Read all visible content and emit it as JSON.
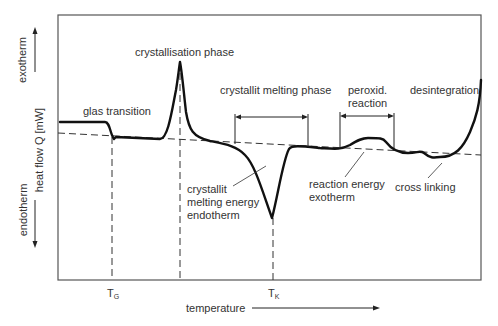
{
  "diagram": {
    "y_axis": {
      "label": "heat flow Q [mW]",
      "up_label": "exotherm",
      "down_label": "endotherm"
    },
    "x_axis": {
      "label": "temperature",
      "markers": [
        {
          "name": "T",
          "sub": "G"
        },
        {
          "name": "T",
          "sub": "K"
        }
      ]
    },
    "annotations": {
      "glass_transition": "glas transition",
      "crystallisation": "crystallisation phase",
      "crystallit_melting_phase": "crystallit melting phase",
      "peroxid_line1": "peroxid.",
      "peroxid_line2": "reaction",
      "desintegration": "desintegration",
      "melting_energy_line1": "crystallit",
      "melting_energy_line2": "melting energy",
      "melting_energy_line3": "endotherm",
      "reaction_energy_line1": "reaction energy",
      "reaction_energy_line2": "exotherm",
      "cross_linking": "cross linking"
    },
    "colors": {
      "curve": "#111111",
      "frame": "#555555",
      "text": "#333333"
    }
  }
}
